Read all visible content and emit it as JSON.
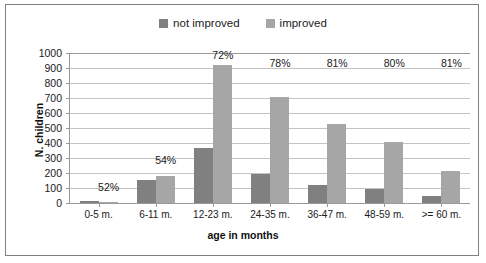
{
  "chart_data": {
    "type": "bar",
    "title": "",
    "xlabel": "age in months",
    "ylabel": "N. children",
    "ylim": [
      0,
      1000
    ],
    "ytick_values": [
      1000,
      900,
      800,
      700,
      600,
      500,
      400,
      300,
      200,
      100,
      0
    ],
    "ytick_labels": [
      "1000",
      "900",
      "800",
      "700",
      "600",
      "500",
      "400",
      "300",
      "200",
      "100",
      "0"
    ],
    "grid": true,
    "legend_position": "top-center",
    "categories": [
      "0-5 m.",
      "6-11 m.",
      "12-23 m.",
      "24-35 m.",
      "36-47 m.",
      "48-59 m.",
      ">= 60 m."
    ],
    "series": [
      {
        "name": "not improved",
        "color": "#808080",
        "values": [
          12,
          152,
          365,
          195,
          120,
          93,
          45
        ]
      },
      {
        "name": "improved",
        "color": "#a6a6a6",
        "values": [
          10,
          182,
          920,
          710,
          530,
          405,
          215
        ]
      }
    ],
    "annotations": [
      {
        "text": "52%",
        "category": "0-5 m.",
        "value": 100
      },
      {
        "text": "54%",
        "category": "6-11 m.",
        "value": 280
      },
      {
        "text": "72%",
        "category": "12-23 m.",
        "value": 980
      },
      {
        "text": "78%",
        "category": "24-35 m.",
        "value": 930
      },
      {
        "text": "81%",
        "category": "36-47 m.",
        "value": 930
      },
      {
        "text": "80%",
        "category": "48-59 m.",
        "value": 930
      },
      {
        "text": "81%",
        "category": ">= 60 m.",
        "value": 930
      }
    ]
  }
}
